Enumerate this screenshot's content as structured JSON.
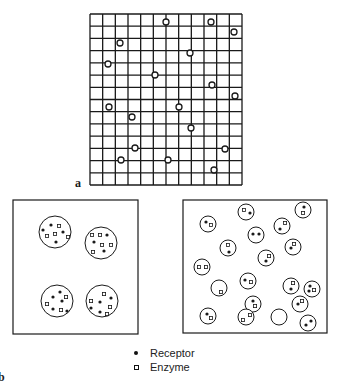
{
  "figure": {
    "panel_a_label": "a",
    "panel_b_label": "b",
    "grid": {
      "x": 90,
      "y": 14,
      "width": 152,
      "height": 171,
      "cols": 12,
      "rows": 14,
      "markers": [
        {
          "x": 166,
          "y": 22
        },
        {
          "x": 211,
          "y": 22
        },
        {
          "x": 234,
          "y": 32
        },
        {
          "x": 120,
          "y": 43
        },
        {
          "x": 190,
          "y": 53
        },
        {
          "x": 108,
          "y": 64
        },
        {
          "x": 155,
          "y": 75
        },
        {
          "x": 212,
          "y": 85
        },
        {
          "x": 235,
          "y": 96
        },
        {
          "x": 109,
          "y": 107
        },
        {
          "x": 179,
          "y": 107
        },
        {
          "x": 132,
          "y": 117
        },
        {
          "x": 191,
          "y": 128
        },
        {
          "x": 225,
          "y": 149
        },
        {
          "x": 121,
          "y": 160
        },
        {
          "x": 168,
          "y": 160
        },
        {
          "x": 214,
          "y": 170
        },
        {
          "x": 135,
          "y": 148
        }
      ]
    },
    "clustered_panel": {
      "x": 13,
      "y": 200,
      "width": 125,
      "height": 134,
      "clusters": [
        {
          "cx": 55,
          "cy": 232,
          "r": 16,
          "receptors": [
            [
              43,
              230
            ],
            [
              51,
              225
            ],
            [
              63,
              232
            ],
            [
              56,
              242
            ]
          ],
          "enzymes": [
            [
              59,
              226
            ],
            [
              47,
              236
            ],
            [
              55,
              234
            ],
            [
              68,
              237
            ]
          ]
        },
        {
          "cx": 101,
          "cy": 243,
          "r": 16,
          "receptors": [
            [
              107,
              235
            ],
            [
              94,
              242
            ],
            [
              104,
              251
            ]
          ],
          "enzymes": [
            [
              92,
              235
            ],
            [
              100,
              235
            ],
            [
              102,
              245
            ],
            [
              111,
              245
            ],
            [
              93,
              252
            ]
          ]
        },
        {
          "cx": 57,
          "cy": 301,
          "r": 16,
          "receptors": [
            [
              53,
              297
            ],
            [
              60,
              292
            ],
            [
              62,
              301
            ],
            [
              53,
              309
            ],
            [
              67,
              311
            ]
          ],
          "enzymes": [
            [
              66,
              297
            ],
            [
              47,
              304
            ],
            [
              61,
              310
            ]
          ]
        },
        {
          "cx": 102,
          "cy": 301,
          "r": 16,
          "receptors": [
            [
              100,
              302
            ],
            [
              111,
              298
            ],
            [
              91,
              308
            ],
            [
              100,
              312
            ]
          ],
          "enzymes": [
            [
              104,
              294
            ],
            [
              91,
              301
            ],
            [
              110,
              307
            ],
            [
              107,
              314
            ]
          ]
        }
      ]
    },
    "dispersed_panel": {
      "x": 183,
      "y": 200,
      "width": 144,
      "height": 133,
      "vesicles": [
        {
          "cx": 246,
          "cy": 212,
          "r": 8,
          "receptors": [
            [
              250,
              213
            ]
          ],
          "enzymes": [
            [
              244,
              210
            ]
          ]
        },
        {
          "cx": 303,
          "cy": 210,
          "r": 8,
          "receptors": [
            [
              304,
              207
            ]
          ],
          "enzymes": [
            [
              303,
              213
            ]
          ]
        },
        {
          "cx": 208,
          "cy": 224,
          "r": 8,
          "receptors": [
            [
              206,
              222
            ]
          ],
          "enzymes": [
            [
              211,
              225
            ]
          ]
        },
        {
          "cx": 282,
          "cy": 226,
          "r": 8,
          "receptors": [
            [
              280,
              229
            ]
          ],
          "enzymes": [
            [
              285,
              223
            ]
          ]
        },
        {
          "cx": 256,
          "cy": 235,
          "r": 8,
          "receptors": [
            [
              253,
              234
            ],
            [
              259,
              234
            ]
          ],
          "enzymes": []
        },
        {
          "cx": 228,
          "cy": 248,
          "r": 8,
          "receptors": [
            [
              229,
              252
            ]
          ],
          "enzymes": [
            [
              228,
              245
            ]
          ]
        },
        {
          "cx": 293,
          "cy": 247,
          "r": 8,
          "receptors": [
            [
              291,
              248
            ]
          ],
          "enzymes": [
            [
              294,
              244
            ]
          ]
        },
        {
          "cx": 266,
          "cy": 258,
          "r": 8,
          "receptors": [
            [
              266,
              261
            ]
          ],
          "enzymes": [
            [
              269,
              256
            ]
          ]
        },
        {
          "cx": 202,
          "cy": 267,
          "r": 8,
          "receptors": [],
          "enzymes": [
            [
              199,
              267
            ],
            [
              206,
              267
            ]
          ]
        },
        {
          "cx": 248,
          "cy": 281,
          "r": 8,
          "receptors": [
            [
              245,
              280
            ]
          ],
          "enzymes": [
            [
              251,
              282
            ]
          ]
        },
        {
          "cx": 291,
          "cy": 286,
          "r": 8,
          "receptors": [
            [
              291,
              289
            ]
          ],
          "enzymes": [
            [
              293,
              283
            ]
          ]
        },
        {
          "cx": 219,
          "cy": 288,
          "r": 8,
          "receptors": [],
          "enzymes": [
            [
              221,
              292
            ]
          ]
        },
        {
          "cx": 312,
          "cy": 289,
          "r": 8,
          "receptors": [
            [
              310,
              286
            ],
            [
              309,
              291
            ]
          ],
          "enzymes": [
            [
              314,
              290
            ]
          ]
        },
        {
          "cx": 253,
          "cy": 304,
          "r": 8,
          "receptors": [
            [
              253,
              301
            ]
          ],
          "enzymes": [
            [
              255,
              306
            ]
          ]
        },
        {
          "cx": 300,
          "cy": 304,
          "r": 8,
          "receptors": [
            [
              298,
              304
            ]
          ],
          "enzymes": [
            [
              302,
              301
            ]
          ]
        },
        {
          "cx": 246,
          "cy": 317,
          "r": 8,
          "receptors": [],
          "enzymes": [
            [
              243,
              320
            ],
            [
              250,
              315
            ]
          ]
        },
        {
          "cx": 208,
          "cy": 316,
          "r": 8,
          "receptors": [
            [
              207,
              314
            ]
          ],
          "enzymes": [
            [
              211,
              318
            ]
          ]
        },
        {
          "cx": 308,
          "cy": 323,
          "r": 8,
          "receptors": [
            [
              306,
              325
            ],
            [
              311,
              321
            ]
          ],
          "enzymes": []
        },
        {
          "cx": 279,
          "cy": 317,
          "r": 8,
          "receptors": [],
          "enzymes": []
        }
      ]
    },
    "legend": [
      {
        "symbol": "filled-dot",
        "label": "Receptor"
      },
      {
        "symbol": "open-square",
        "label": "Enzyme"
      }
    ],
    "colors": {
      "ink": "#1a1a1a",
      "background": "#ffffff"
    }
  }
}
